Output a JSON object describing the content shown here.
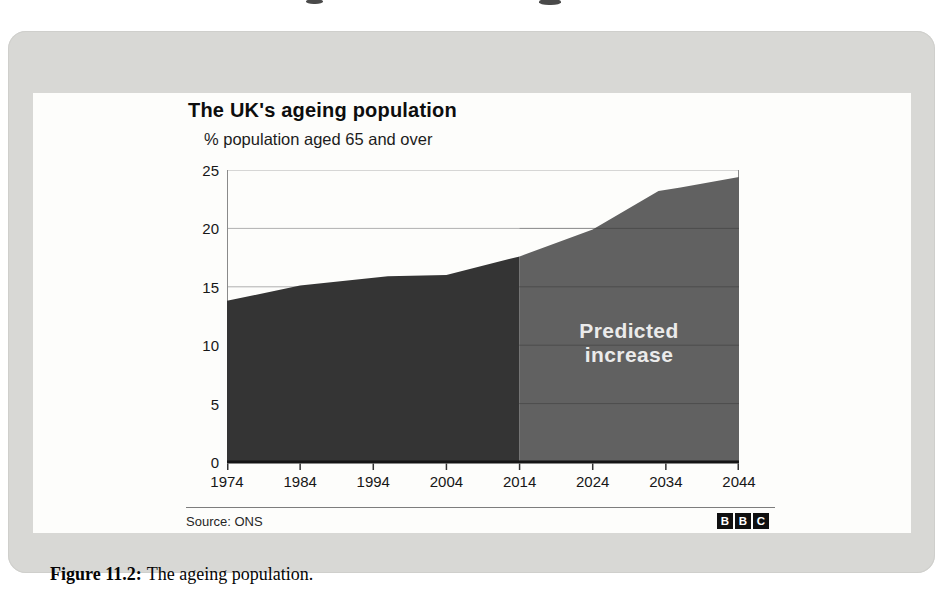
{
  "figure": {
    "caption_label": "Figure 11.2:",
    "caption_text": "The ageing population."
  },
  "chart": {
    "title": "The UK's ageing population",
    "subtitle": "% population aged 65 and over",
    "source": "Source: ONS",
    "logo_letters": [
      "B",
      "B",
      "C"
    ],
    "predicted_label_line1": "Predicted",
    "predicted_label_line2": "increase"
  },
  "chart_data": {
    "type": "area",
    "title": "The UK's ageing population",
    "subtitle": "% population aged 65 and over",
    "xlabel": "",
    "ylabel": "% population aged 65 and over",
    "xlim": [
      1974,
      2044
    ],
    "ylim": [
      0,
      25
    ],
    "x_ticks": [
      1974,
      1984,
      1994,
      2004,
      2014,
      2024,
      2034,
      2044
    ],
    "y_ticks": [
      25,
      20,
      15,
      10,
      5,
      0
    ],
    "grid": true,
    "legend": "none",
    "split_year": 2014,
    "annotation": "Predicted increase",
    "source": "Source: ONS",
    "colors": {
      "actual": "#343434",
      "predicted": "#616161",
      "gridline": "#b0b0b0"
    },
    "series": [
      {
        "name": "% population aged 65 and over",
        "points": [
          [
            1974,
            13.8
          ],
          [
            1984,
            15.1
          ],
          [
            1996,
            15.9
          ],
          [
            2004,
            16.0
          ],
          [
            2014,
            17.6
          ],
          [
            2024,
            19.9
          ],
          [
            2033,
            23.2
          ],
          [
            2036,
            23.5
          ],
          [
            2044,
            24.4
          ]
        ]
      }
    ],
    "decade_values": {
      "categories": [
        1974,
        1984,
        1994,
        2004,
        2014,
        2024,
        2034,
        2044
      ],
      "values": [
        13.8,
        15.1,
        15.8,
        16.0,
        17.6,
        19.9,
        23.3,
        24.4
      ]
    }
  }
}
